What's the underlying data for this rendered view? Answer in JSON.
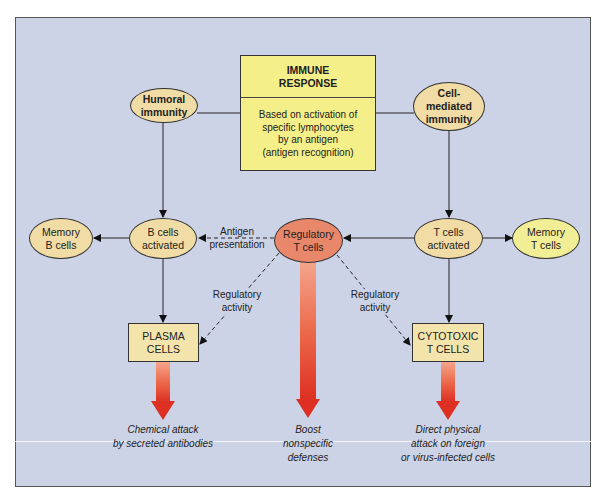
{
  "diagram": {
    "central": {
      "title_line1": "IMMUNE",
      "title_line2": "RESPONSE",
      "body_line1": "Based on activation of",
      "body_line2": "specific lymphocytes",
      "body_line3": "by an antigen",
      "body_line4": "(antigen recognition)"
    },
    "nodes": {
      "humoral": {
        "line1": "Humoral",
        "line2": "immunity"
      },
      "cell_mediated": {
        "line1": "Cell-",
        "line2": "mediated",
        "line3": "immunity"
      },
      "memory_b": {
        "line1": "Memory",
        "line2": "B cells"
      },
      "b_activated": {
        "line1": "B cells",
        "line2": "activated"
      },
      "regulatory_t": {
        "line1": "Regulatory",
        "line2": "T cells"
      },
      "t_activated": {
        "line1": "T cells",
        "line2": "activated"
      },
      "memory_t": {
        "line1": "Memory",
        "line2": "T cells"
      },
      "plasma": {
        "line1": "PLASMA",
        "line2": "CELLS"
      },
      "cytotoxic": {
        "line1": "CYTOTOXIC",
        "line2": "T CELLS"
      }
    },
    "edge_labels": {
      "antigen_presentation": {
        "line1": "Antigen",
        "line2": "presentation"
      },
      "regulatory_left": {
        "line1": "Regulatory",
        "line2": "activity"
      },
      "regulatory_right": {
        "line1": "Regulatory",
        "line2": "activity"
      }
    },
    "outcomes": {
      "plasma": {
        "line1": "Chemical attack",
        "line2": "by secreted antibodies"
      },
      "regulatory": {
        "line1": "Boost",
        "line2": "nonspecific",
        "line3": "defenses"
      },
      "cytotoxic": {
        "line1": "Direct physical",
        "line2": "attack on foreign",
        "line3": "or virus-infected cells"
      }
    },
    "colors": {
      "panel_bg": "#cdd3e6",
      "central_box": "#f4ef88",
      "ellipse_tan": "#f0dca4",
      "regulatory": "#e8876a",
      "memory_t": "#f2ee96",
      "arrow_red": "#e03a2a"
    }
  }
}
